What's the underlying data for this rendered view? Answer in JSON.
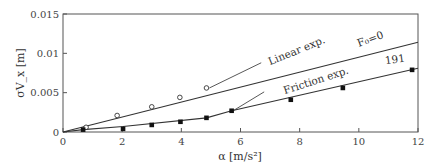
{
  "chart_data": {
    "type": "scatter",
    "title": "",
    "xlabel": "α [m/s²]",
    "ylabel": "σV_x [m]",
    "xlim": [
      0,
      12
    ],
    "ylim": [
      0,
      0.015
    ],
    "x_ticks": [
      "0",
      "2",
      "4",
      "6",
      "8",
      "10",
      "12"
    ],
    "y_ticks": [
      "0",
      "0.005",
      "0.01",
      "0.015"
    ],
    "grid": false,
    "series": [
      {
        "name": "Linear exp.",
        "marker": "open-circle",
        "points": [
          [
            0.78,
            0.0006
          ],
          [
            1.83,
            0.0021
          ],
          [
            3.0,
            0.0032
          ],
          [
            3.95,
            0.0044
          ],
          [
            4.85,
            0.0056
          ]
        ]
      },
      {
        "name": "Friction exp.",
        "marker": "filled-square",
        "points": [
          [
            0.68,
            0.0003
          ],
          [
            2.03,
            0.0004
          ],
          [
            3.0,
            0.0009
          ],
          [
            3.97,
            0.0013
          ],
          [
            4.85,
            0.0018
          ],
          [
            5.7,
            0.0027
          ],
          [
            7.7,
            0.0041
          ],
          [
            9.46,
            0.0056
          ],
          [
            11.8,
            0.0079
          ]
        ]
      },
      {
        "name": "F₀=0",
        "marker": "line",
        "points": [
          [
            0,
            0
          ],
          [
            12,
            0.0114
          ]
        ]
      },
      {
        "name": "191",
        "marker": "line",
        "points": [
          [
            0,
            0
          ],
          [
            0.68,
            0.0003
          ],
          [
            2.03,
            0.0007
          ],
          [
            4.85,
            0.0018
          ],
          [
            5.7,
            0.0027
          ],
          [
            12,
            0.0081
          ]
        ]
      }
    ],
    "annotations": [
      {
        "text": "Linear exp.",
        "x": 7.0,
        "y": 0.0085
      },
      {
        "text": "Friction exp.",
        "x": 7.5,
        "y": 0.0048
      },
      {
        "text": "F₀=0",
        "x": 10.0,
        "y": 0.0108
      },
      {
        "text": "191",
        "x": 10.9,
        "y": 0.0086
      }
    ]
  }
}
